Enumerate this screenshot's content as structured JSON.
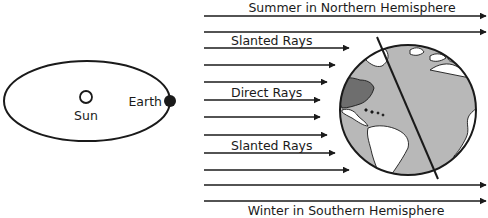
{
  "diagram": {
    "title_top": "Summer in Northern Hemisphere",
    "title_bottom": "Winter in Southern Hemisphere",
    "orbit": {
      "sun_label": "Sun",
      "earth_label": "Earth"
    },
    "rays": {
      "upper_label": "Slanted Rays",
      "middle_label": "Direct Rays",
      "lower_label": "Slanted Rays"
    },
    "colors": {
      "line": "#1a1a1a",
      "ocean": "#b8b8b8",
      "land": "#ffffff",
      "highlight_region": "#6e6e6e"
    }
  }
}
